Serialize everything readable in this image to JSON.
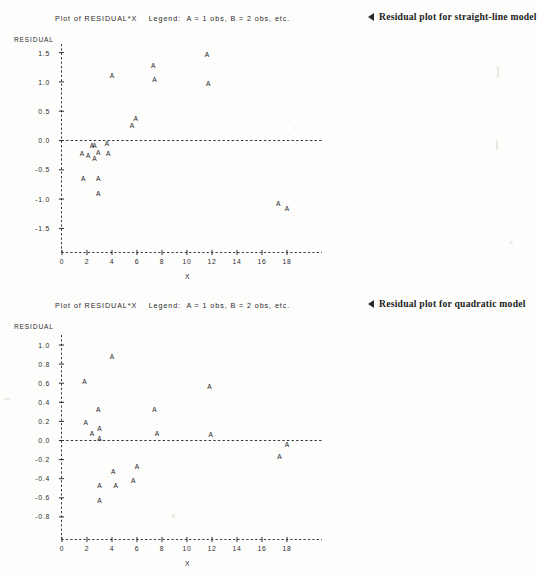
{
  "document": {
    "type": "scanned-statistics-figure",
    "background_color": "#fdfdfc",
    "ink_color": "#1c1c1c"
  },
  "charts": [
    {
      "id": "residual-plot-straight-line",
      "title": "Plot of RESIDUAL*X    Legend:  A = 1 obs, B = 2 obs, etc.",
      "annotation": "Residual plot for straight-line model",
      "annotation_marker": "left-triangle-icon",
      "ylabel": "RESIDUAL",
      "xlabel": "X",
      "yticks": [
        "1.5",
        "1.0",
        "0.5",
        "0.0",
        "-0.5",
        "-1.0",
        "-1.5"
      ],
      "xticks": [
        "0",
        "2",
        "4",
        "6",
        "8",
        "10",
        "12",
        "14",
        "16",
        "18"
      ]
    },
    {
      "id": "residual-plot-quadratic",
      "title": "Plot of RESIDUAL*X    Legend:  A = 1 obs, B = 2 obs, etc.",
      "annotation": "Residual plot for quadratic model",
      "annotation_marker": "left-triangle-icon",
      "ylabel": "RESIDUAL",
      "xlabel": "X",
      "yticks": [
        "1.0",
        "0.8",
        "0.6",
        "0.4",
        "0.2",
        "0.0",
        "-0.2",
        "-0.4",
        "-0.6",
        "-0.8"
      ],
      "xticks": [
        "0",
        "2",
        "4",
        "6",
        "8",
        "10",
        "12",
        "14",
        "16",
        "18"
      ]
    }
  ],
  "chart_data": [
    {
      "type": "scatter",
      "title": "Plot of RESIDUAL*X    Legend:  A = 1 obs, B = 2 obs, etc.",
      "subtitle": "Residual plot for straight-line model",
      "xlabel": "X",
      "ylabel": "RESIDUAL",
      "xlim": [
        -0.9,
        20.0
      ],
      "ylim": [
        -1.75,
        1.75
      ],
      "xticks": [
        0,
        2,
        4,
        6,
        8,
        10,
        12,
        14,
        16,
        18
      ],
      "yticks": [
        -1.5,
        -1.0,
        -0.5,
        0.0,
        0.5,
        1.0,
        1.5
      ],
      "grid": false,
      "legend": "A = 1 obs, B = 2 obs, etc.",
      "marker_label": "A",
      "reference_line_y": 0.0,
      "series": [
        {
          "name": "residuals",
          "points": [
            {
              "x": 1.6,
              "y": -0.26,
              "label": "A"
            },
            {
              "x": 1.7,
              "y": -0.69,
              "label": "A"
            },
            {
              "x": 2.1,
              "y": -0.3,
              "label": "A"
            },
            {
              "x": 2.4,
              "y": -0.12,
              "label": "A"
            },
            {
              "x": 2.6,
              "y": -0.12,
              "label": "A"
            },
            {
              "x": 2.6,
              "y": -0.35,
              "label": "A"
            },
            {
              "x": 2.9,
              "y": -0.24,
              "label": "A"
            },
            {
              "x": 2.9,
              "y": -0.69,
              "label": "A"
            },
            {
              "x": 2.9,
              "y": -0.95,
              "label": "A"
            },
            {
              "x": 3.6,
              "y": -0.09,
              "label": "A"
            },
            {
              "x": 3.7,
              "y": -0.27,
              "label": "A"
            },
            {
              "x": 4.0,
              "y": 1.07,
              "label": "A"
            },
            {
              "x": 5.6,
              "y": 0.22,
              "label": "A"
            },
            {
              "x": 5.9,
              "y": 0.34,
              "label": "A"
            },
            {
              "x": 7.3,
              "y": 1.24,
              "label": "A"
            },
            {
              "x": 7.4,
              "y": 1.0,
              "label": "A"
            },
            {
              "x": 11.6,
              "y": 1.43,
              "label": "A"
            },
            {
              "x": 11.7,
              "y": 0.93,
              "label": "A"
            },
            {
              "x": 17.3,
              "y": -1.11,
              "label": "A"
            },
            {
              "x": 18.0,
              "y": -1.21,
              "label": "A"
            }
          ]
        }
      ]
    },
    {
      "type": "scatter",
      "title": "Plot of RESIDUAL*X    Legend:  A = 1 obs, B = 2 obs, etc.",
      "subtitle": "Residual plot for quadratic model",
      "xlabel": "X",
      "ylabel": "RESIDUAL",
      "xlim": [
        -0.9,
        20.0
      ],
      "ylim": [
        -1.0,
        1.1
      ],
      "xticks": [
        0,
        2,
        4,
        6,
        8,
        10,
        12,
        14,
        16,
        18
      ],
      "yticks": [
        -0.8,
        -0.6,
        -0.4,
        -0.2,
        0.0,
        0.2,
        0.4,
        0.6,
        0.8,
        1.0
      ],
      "grid": false,
      "legend": "A = 1 obs, B = 2 obs, etc.",
      "marker_label": "A",
      "reference_line_y": 0.0,
      "series": [
        {
          "name": "residuals",
          "points": [
            {
              "x": 1.8,
              "y": 0.59,
              "label": "A"
            },
            {
              "x": 1.9,
              "y": 0.16,
              "label": "A"
            },
            {
              "x": 2.4,
              "y": 0.05,
              "label": "A"
            },
            {
              "x": 2.9,
              "y": 0.3,
              "label": "A"
            },
            {
              "x": 3.0,
              "y": 0.1,
              "label": "A"
            },
            {
              "x": 3.0,
              "y": -0.01,
              "label": "A"
            },
            {
              "x": 3.0,
              "y": -0.5,
              "label": "A"
            },
            {
              "x": 3.0,
              "y": -0.65,
              "label": "A"
            },
            {
              "x": 4.0,
              "y": 0.85,
              "label": "A"
            },
            {
              "x": 4.1,
              "y": -0.35,
              "label": "A"
            },
            {
              "x": 4.3,
              "y": -0.5,
              "label": "A"
            },
            {
              "x": 5.7,
              "y": -0.45,
              "label": "A"
            },
            {
              "x": 6.0,
              "y": -0.3,
              "label": "A"
            },
            {
              "x": 7.4,
              "y": 0.3,
              "label": "A"
            },
            {
              "x": 7.6,
              "y": 0.05,
              "label": "A"
            },
            {
              "x": 11.8,
              "y": 0.54,
              "label": "A"
            },
            {
              "x": 11.9,
              "y": 0.04,
              "label": "A"
            },
            {
              "x": 17.4,
              "y": -0.19,
              "label": "A"
            },
            {
              "x": 18.0,
              "y": -0.07,
              "label": "A"
            }
          ]
        }
      ]
    }
  ]
}
